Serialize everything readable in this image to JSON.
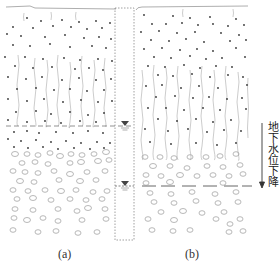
{
  "figure": {
    "panels": [
      {
        "id": "a",
        "caption": "(a)",
        "water_table_y": 126,
        "fissure_bottom_y": 126
      },
      {
        "id": "b",
        "caption": "(b)",
        "water_table_y": 186,
        "fissure_bottom_y": 150
      }
    ],
    "side_label": "地下水位下降",
    "side_label_arrow": "down-arrow-icon",
    "water_table_symbol": "▼",
    "well": {
      "x": 115,
      "y": 8,
      "width": 19,
      "height": 232
    },
    "colors": {
      "line": "#8a8a8a",
      "dot": "#333333",
      "pebble": "#9a9a9a",
      "marker": "#444444",
      "text": "#222222"
    }
  }
}
